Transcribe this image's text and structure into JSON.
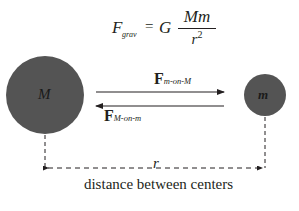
{
  "formula": {
    "lhs": "F",
    "lhs_subscript": "grav",
    "equals": "=",
    "constant": "G",
    "numerator": "Mm",
    "denominator": "r",
    "denominator_exponent": "2"
  },
  "masses": {
    "large": {
      "label": "M",
      "color": "#545454"
    },
    "small": {
      "label": "m",
      "color": "#545454"
    }
  },
  "forces": {
    "on_M": {
      "symbol": "F",
      "subscript": "m-on-M",
      "direction": "right"
    },
    "on_m": {
      "symbol": "F",
      "subscript": "M-on-m",
      "direction": "left"
    }
  },
  "distance": {
    "label": "r",
    "caption": "distance between centers"
  }
}
